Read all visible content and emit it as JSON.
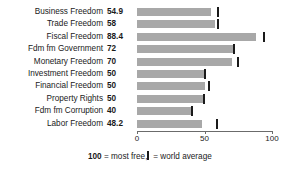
{
  "chart_data": {
    "type": "bar",
    "orientation": "horizontal",
    "title": "",
    "xlabel": "",
    "ylabel": "",
    "xlim": [
      0,
      100
    ],
    "grid": false,
    "categories": [
      "Business Freedom",
      "Trade Freedom",
      "Fiscal Freedom",
      "Fdm fm Government",
      "Monetary Freedom",
      "Investment Freedom",
      "Financial Freedom",
      "Property Rights",
      "Fdm fm Corruption",
      "Labor Freedom"
    ],
    "values": [
      54.9,
      58,
      88.4,
      72,
      70,
      50,
      50,
      50,
      40,
      48.2
    ],
    "value_labels": [
      "54.9",
      "58",
      "88.4",
      "72",
      "70",
      "50",
      "50",
      "50",
      "40",
      "48.2"
    ],
    "series": [
      {
        "name": "Score",
        "values": [
          54.9,
          58,
          88.4,
          72,
          70,
          50,
          50,
          50,
          40,
          48.2
        ]
      },
      {
        "name": "world average",
        "marker": "vertical-tick",
        "values": [
          59.5,
          59.0,
          93.5,
          71.0,
          74.0,
          49.5,
          52.5,
          49.0,
          40.0,
          58.5
        ]
      }
    ],
    "axis": {
      "ticks": [
        0,
        50,
        100
      ],
      "tick_labels": [
        "0",
        "50",
        "100"
      ]
    },
    "legend": {
      "most_free_value": "100",
      "most_free_text": " = most free,",
      "world_average_text": " = world average"
    },
    "colors": {
      "bar": "#a8a8a8",
      "average_marker": "#1a1a1a",
      "axis": "#6b6b6b",
      "text": "#1a1a1a",
      "background": "#ffffff"
    }
  }
}
